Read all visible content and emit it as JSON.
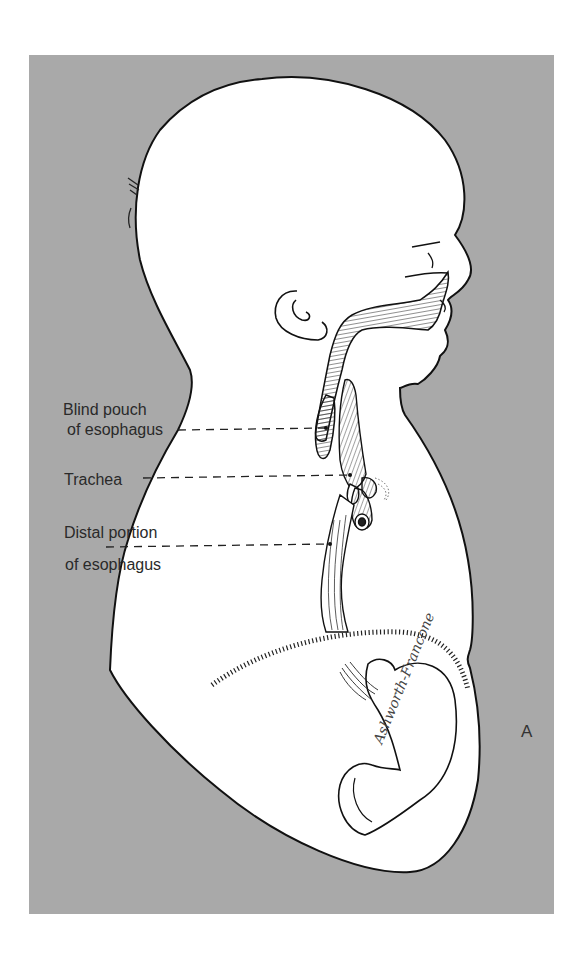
{
  "figure": {
    "panel_label": "A",
    "signature": "Ashworth-Francone",
    "background_color": "#a9a9a9",
    "body_color": "#ffffff",
    "line_color": "#111111"
  },
  "labels": [
    {
      "line1": "Blind pouch",
      "line2": "of esophagus"
    },
    {
      "line1": "Trachea"
    },
    {
      "line1": "Distal portion",
      "line2": "of esophagus"
    }
  ]
}
